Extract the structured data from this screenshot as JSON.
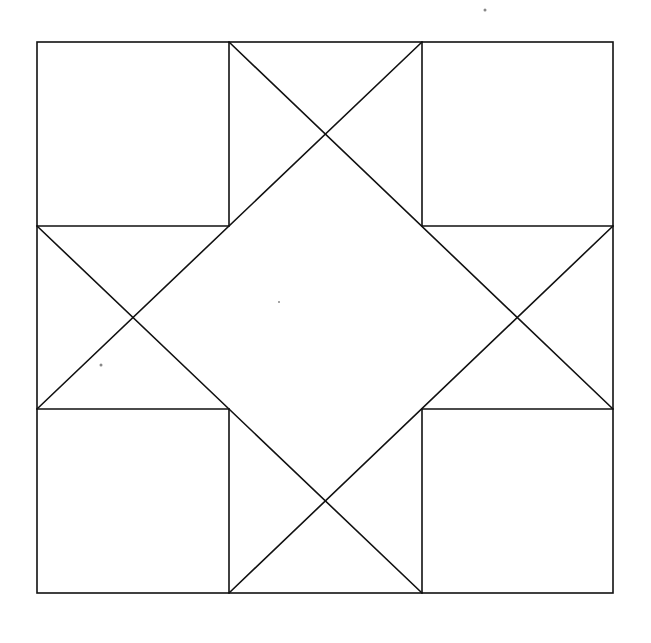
{
  "diagram": {
    "stroke_color": "#111111",
    "background": "#ffffff",
    "outer_square": {
      "x1": 37,
      "y1": 42,
      "x2": 613,
      "y2": 593
    },
    "grid": {
      "x": [
        37,
        229,
        422,
        613
      ],
      "y": [
        42,
        226,
        409,
        593
      ]
    }
  }
}
